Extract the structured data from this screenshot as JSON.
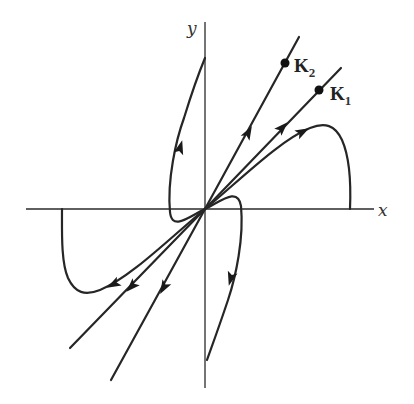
{
  "diagram": {
    "type": "phase-portrait",
    "axes": {
      "x_label": "x",
      "y_label": "y"
    },
    "eigenvectors": [
      {
        "name": "K2",
        "label_main": "K",
        "label_sub": "2",
        "direction": "steep line through origin, upper-right to lower-left"
      },
      {
        "name": "K1",
        "label_main": "K",
        "label_sub": "1",
        "direction": "shallower line through origin, upper-right to lower-left"
      }
    ],
    "trajectories": [
      {
        "id": "k2-ray-upper",
        "direction": "outward from origin along K2, upper right"
      },
      {
        "id": "k2-ray-lower",
        "direction": "outward from origin along K2, lower left"
      },
      {
        "id": "k1-ray-upper",
        "direction": "outward from origin along K1, upper right"
      },
      {
        "id": "k1-ray-lower",
        "direction": "outward from origin along K1, lower left"
      },
      {
        "id": "curve-upper-left",
        "direction": "leaves origin, loops left, rises steeply upward near y-axis"
      },
      {
        "id": "curve-lower-right",
        "direction": "leaves origin, loops right, descends steeply near y-axis"
      },
      {
        "id": "curve-right-arch",
        "direction": "leaves origin along K1, arches over and descends to positive x-axis"
      },
      {
        "id": "curve-left-arch",
        "direction": "leaves origin along K1, dips under and rises to negative x-axis"
      }
    ],
    "colors": {
      "stroke": "#262626",
      "background": "#ffffff"
    }
  }
}
